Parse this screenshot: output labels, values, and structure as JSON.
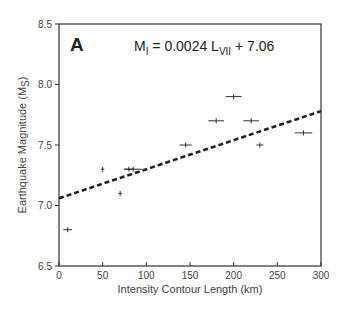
{
  "chart_data": {
    "type": "scatter",
    "panel_label": "A",
    "title": "",
    "equation": {
      "lhs_main": "M",
      "lhs_sub": "I",
      "mid": " = 0.0024 L",
      "mid_sub": "VII",
      "rhs": " + 7.06",
      "slope": 0.0024,
      "intercept": 7.06
    },
    "xlabel": "Intensity Contour Length (km)",
    "ylabel_main": "Earthquake Magnitude (M",
    "ylabel_sub": "S",
    "ylabel_end": ")",
    "xlim": [
      0,
      300
    ],
    "ylim": [
      6.5,
      8.5
    ],
    "x_ticks": [
      0,
      50,
      100,
      150,
      200,
      250,
      300
    ],
    "x_tick_labels": [
      "0",
      "50",
      "100",
      "150",
      "200",
      "250",
      "300"
    ],
    "y_ticks": [
      6.5,
      7.0,
      7.5,
      8.0,
      8.5
    ],
    "y_tick_labels": [
      "6.5",
      "7.0",
      "7.5",
      "8.0",
      "8.5"
    ],
    "grid": false,
    "legend": null,
    "points": [
      {
        "x": 10,
        "y": 6.8,
        "xerr": 5
      },
      {
        "x": 50,
        "y": 7.3,
        "xerr": 2
      },
      {
        "x": 70,
        "y": 7.1,
        "xerr": 2
      },
      {
        "x": 80,
        "y": 7.3,
        "xerr": 6
      },
      {
        "x": 85,
        "y": 7.3,
        "xerr": 10
      },
      {
        "x": 145,
        "y": 7.5,
        "xerr": 7
      },
      {
        "x": 180,
        "y": 7.7,
        "xerr": 9
      },
      {
        "x": 200,
        "y": 7.9,
        "xerr": 9
      },
      {
        "x": 220,
        "y": 7.7,
        "xerr": 9
      },
      {
        "x": 230,
        "y": 7.5,
        "xerr": 4
      },
      {
        "x": 280,
        "y": 7.6,
        "xerr": 10
      }
    ],
    "fit_line": {
      "style": "dashed",
      "x": [
        0,
        300
      ],
      "y": [
        7.06,
        7.78
      ]
    }
  }
}
